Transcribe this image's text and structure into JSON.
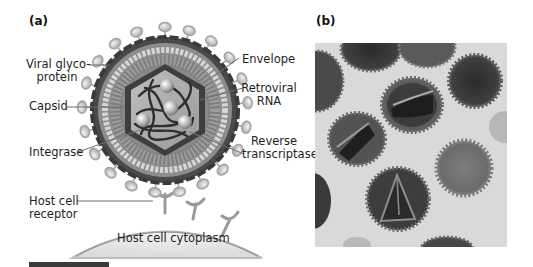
{
  "panels": {
    "a": {
      "label": "(a)",
      "labels": {
        "viral_glycoprotein_line1": "Viral glyco-",
        "viral_glycoprotein_line2": "protein",
        "capsid": "Capsid",
        "integrase": "Integrase",
        "host_cell_receptor_line1": "Host cell",
        "host_cell_receptor_line2": "receptor",
        "envelope": "Envelope",
        "retroviral_rna_line1": "Retroviral",
        "retroviral_rna_line2": "RNA",
        "reverse_transcriptase_line1": "Reverse",
        "reverse_transcriptase_line2": "transcriptase",
        "host_cell_cytoplasm": "Host cell cytoplasm"
      }
    },
    "b": {
      "label": "(b)",
      "description": "Electron micrograph of retrovirus particles"
    }
  }
}
